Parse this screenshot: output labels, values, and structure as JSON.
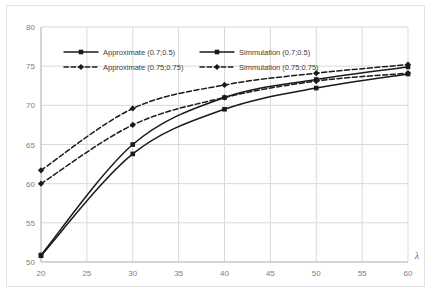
{
  "chart_data": {
    "type": "line",
    "title": "",
    "xlabel": "λ",
    "ylabel": "",
    "xlim": [
      20,
      60
    ],
    "ylim": [
      50,
      80
    ],
    "xticks": [
      20,
      25,
      30,
      35,
      40,
      45,
      50,
      55,
      60
    ],
    "yticks": [
      50,
      55,
      60,
      65,
      70,
      75,
      80
    ],
    "grid": true,
    "legend_position": "upper-left-inside",
    "x": [
      20,
      30,
      40,
      50,
      60
    ],
    "series": [
      {
        "name": "Approximate (0.7;0.5)",
        "values": [
          50.8,
          63.8,
          69.5,
          72.2,
          74.0
        ],
        "style": "solid",
        "marker": "square",
        "color": "#1a1a1a"
      },
      {
        "name": "Simmulation (0.7;0.5)",
        "values": [
          50.9,
          65.0,
          71.0,
          73.3,
          74.9
        ],
        "style": "solid",
        "marker": "square",
        "color": "#1a1a1a"
      },
      {
        "name": "Approximate (0.75;0.75)",
        "values": [
          60.0,
          67.5,
          71.0,
          73.1,
          74.1
        ],
        "style": "dashed",
        "marker": "diamond",
        "color": "#1a1a1a"
      },
      {
        "name": "Simmulation (0.75;0.75)",
        "values": [
          61.7,
          69.6,
          72.6,
          74.1,
          75.2
        ],
        "style": "dashed",
        "marker": "diamond",
        "color": "#1a1a1a"
      }
    ]
  },
  "legend": {
    "entries": [
      {
        "label": "Approximate (0.7;0.5)",
        "style": "solid",
        "marker": "square"
      },
      {
        "label": "Simmulation (0.7;0.5)",
        "style": "solid",
        "marker": "square"
      },
      {
        "label": "Approximate (0.75;0.75)",
        "style": "dashed",
        "marker": "diamond"
      },
      {
        "label": "Simmulation (0.75;0.75)",
        "style": "dashed",
        "marker": "diamond"
      }
    ]
  },
  "axis": {
    "x_tick_labels": [
      "20",
      "25",
      "30",
      "35",
      "40",
      "45",
      "50",
      "55",
      "60"
    ],
    "y_tick_labels": [
      "50",
      "55",
      "60",
      "65",
      "70",
      "75",
      "80"
    ],
    "x_axis_title": "λ"
  },
  "colors": {
    "line": "#1a1a1a",
    "grid": "#d9d9d9",
    "axis": "#bfbfbf",
    "tick_label": "#808080",
    "frame": "#e2e2e2",
    "background": "#ffffff"
  }
}
